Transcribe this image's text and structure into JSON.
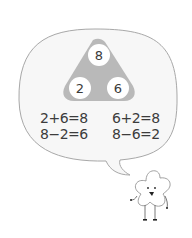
{
  "number_bond": {
    "whole": "8",
    "part_left": "2",
    "part_right": "6"
  },
  "equations": [
    "2+6=8",
    "6+2=8",
    "8−2=6",
    "8−6=2"
  ],
  "colors": {
    "triangle": "#b9b9b9",
    "circle": "#ffffff",
    "bubble_fill": "#f7f7f7",
    "bubble_stroke": "#a8a8a8",
    "text": "#3a3a3a"
  }
}
